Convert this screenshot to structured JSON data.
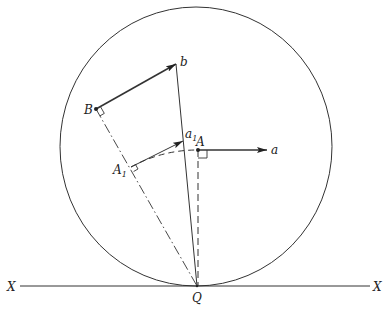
{
  "diagram": {
    "type": "geometric-construction",
    "labels": {
      "b": "b",
      "B": "B",
      "a1": "a",
      "a1_sub": "1",
      "A": "A",
      "A1": "A",
      "A1_sub": "1",
      "a": "a",
      "Q": "Q",
      "X_left": "X",
      "X_right": "X"
    },
    "elements": [
      {
        "id": "circle",
        "kind": "circle",
        "style": "solid"
      },
      {
        "id": "ground-line",
        "kind": "line",
        "from": "X",
        "to": "X",
        "style": "solid"
      },
      {
        "id": "vector-Bb",
        "kind": "arrow",
        "from": "B",
        "to": "b",
        "style": "solid-bold"
      },
      {
        "id": "line-bQ",
        "kind": "line",
        "from": "b",
        "to": "Q",
        "style": "solid"
      },
      {
        "id": "line-BQ",
        "kind": "line",
        "from": "B",
        "to": "Q",
        "style": "dash-dot"
      },
      {
        "id": "vector-A1a1",
        "kind": "arrow",
        "from": "A1",
        "to": "a1",
        "style": "solid"
      },
      {
        "id": "arc-A1A",
        "kind": "arc",
        "from": "A1",
        "to": "A",
        "center": "Q",
        "style": "dashed"
      },
      {
        "id": "vector-Aa",
        "kind": "arrow",
        "from": "A",
        "to": "a",
        "style": "solid-bold"
      },
      {
        "id": "line-AQ",
        "kind": "line",
        "from": "A",
        "to": "Q",
        "style": "dashed"
      }
    ],
    "right_angle_marks": [
      "B",
      "A1",
      "A"
    ]
  }
}
